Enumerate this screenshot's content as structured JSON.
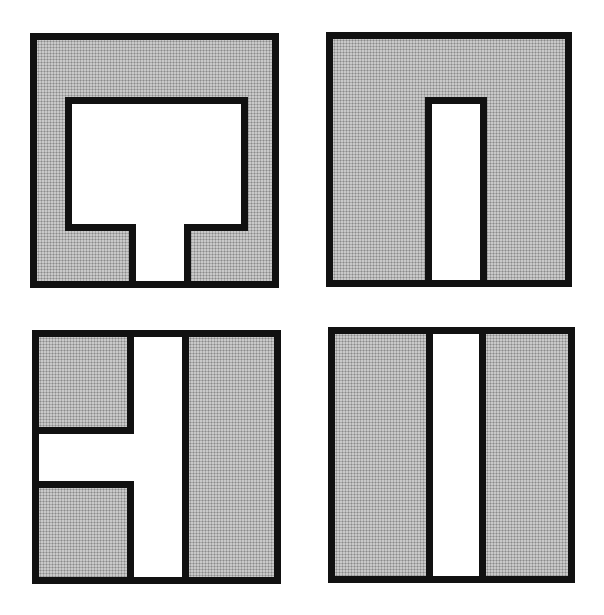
{
  "diagram": {
    "colors": {
      "outline": "#111111",
      "fill": "#c9c9c9",
      "dot": "#8a8a8a",
      "channel": "#ffffff",
      "background": "#ffffff"
    },
    "panels": [
      {
        "id": "top-left",
        "shape": "square-with-T-shaped-cutout"
      },
      {
        "id": "top-right",
        "shape": "square-with-vertical-slot-from-bottom"
      },
      {
        "id": "bottom-left",
        "shape": "square-with-sideways-T-channel"
      },
      {
        "id": "bottom-right",
        "shape": "square-split-by-full-height-vertical-channel"
      }
    ]
  }
}
